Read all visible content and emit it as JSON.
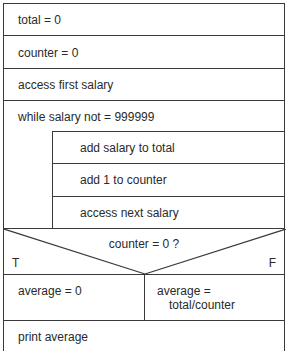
{
  "diagram": {
    "type": "Nassi-Shneiderman structured flowchart",
    "steps": [
      {
        "id": "init_total",
        "text": "total  =  0"
      },
      {
        "id": "init_counter",
        "text": "counter  =  0"
      },
      {
        "id": "access_first",
        "text": "access first salary"
      }
    ],
    "loop": {
      "condition": "while salary not  =  999999",
      "body": [
        {
          "id": "add_salary",
          "text": "add salary to total"
        },
        {
          "id": "add_counter",
          "text": "add 1 to counter"
        },
        {
          "id": "access_next",
          "text": "access next salary"
        }
      ]
    },
    "decision": {
      "condition": "counter  =  0 ?",
      "true_label": "T",
      "false_label": "F",
      "true_branch": "average  =  0",
      "false_branch_line1": "average  =",
      "false_branch_line2": "total/counter"
    },
    "final": {
      "text": "print average"
    },
    "colors": {
      "line": "#3a3a3a",
      "text": "#2a2a2a",
      "background": "#ffffff"
    }
  }
}
